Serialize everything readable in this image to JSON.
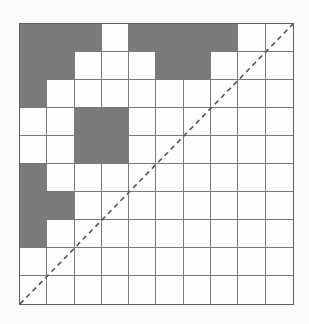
{
  "grid": {
    "rows": 10,
    "cols": 10,
    "filled_color": "#7b7b7b",
    "empty_color": "#fdfdfd",
    "line_color": "#7a7a7a",
    "filled_cells": [
      [
        0,
        0
      ],
      [
        0,
        1
      ],
      [
        0,
        2
      ],
      [
        0,
        4
      ],
      [
        0,
        5
      ],
      [
        0,
        6
      ],
      [
        0,
        7
      ],
      [
        1,
        0
      ],
      [
        1,
        1
      ],
      [
        1,
        5
      ],
      [
        1,
        6
      ],
      [
        2,
        0
      ],
      [
        3,
        2
      ],
      [
        3,
        3
      ],
      [
        4,
        2
      ],
      [
        4,
        3
      ],
      [
        5,
        0
      ],
      [
        6,
        0
      ],
      [
        6,
        1
      ],
      [
        7,
        0
      ]
    ]
  },
  "diagonal": {
    "style": "dashed",
    "from": "bottom-left",
    "to": "top-right",
    "color": "#555555"
  }
}
